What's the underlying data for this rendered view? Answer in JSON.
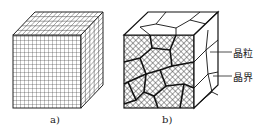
{
  "figure": {
    "panel_a": {
      "caption": "a)"
    },
    "panel_b": {
      "caption": "b)",
      "annotations": [
        {
          "label": "晶粒"
        },
        {
          "label": "晶界"
        }
      ]
    }
  },
  "colors": {
    "line": "#222222",
    "background": "#ffffff"
  }
}
